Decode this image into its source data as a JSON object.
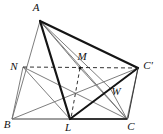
{
  "figure": {
    "type": "geometry-diagram",
    "width": 163,
    "height": 134,
    "background_color": "#ffffff",
    "stroke_color_thin": "#6b6b6b",
    "stroke_color_thick": "#1a1a1a",
    "stroke_color_base": "#9a9a9a",
    "dash_color": "#3a3a3a",
    "labels": [
      {
        "id": "A",
        "text": "A",
        "x": 36,
        "y": 11,
        "anchor": "middle"
      },
      {
        "id": "N",
        "text": "N",
        "x": 14,
        "y": 70,
        "anchor": "middle"
      },
      {
        "id": "M",
        "text": "M",
        "x": 82,
        "y": 60,
        "anchor": "middle"
      },
      {
        "id": "Cp",
        "text": "C'",
        "x": 148,
        "y": 69,
        "anchor": "middle"
      },
      {
        "id": "W",
        "text": "W",
        "x": 116,
        "y": 95,
        "anchor": "middle"
      },
      {
        "id": "B",
        "text": "B",
        "x": 7,
        "y": 128,
        "anchor": "middle"
      },
      {
        "id": "L",
        "text": "L",
        "x": 68,
        "y": 131,
        "anchor": "middle"
      },
      {
        "id": "C",
        "text": "C",
        "x": 131,
        "y": 130,
        "anchor": "middle"
      }
    ],
    "points": {
      "A": {
        "x": 40,
        "y": 21
      },
      "N": {
        "x": 23,
        "y": 67
      },
      "M": {
        "x": 80,
        "y": 68
      },
      "Cp": {
        "x": 138,
        "y": 68
      },
      "W": {
        "x": 110,
        "y": 88
      },
      "B": {
        "x": 12,
        "y": 119
      },
      "L": {
        "x": 70,
        "y": 119
      },
      "C": {
        "x": 127,
        "y": 119
      }
    }
  }
}
